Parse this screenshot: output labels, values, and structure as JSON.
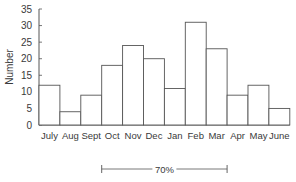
{
  "chart_data": {
    "type": "bar",
    "title": "",
    "xlabel": "",
    "ylabel": "Number",
    "categories": [
      "July",
      "Aug",
      "Sept",
      "Oct",
      "Nov",
      "Dec",
      "Jan",
      "Feb",
      "Mar",
      "Apr",
      "May",
      "June"
    ],
    "values": [
      12,
      4,
      9,
      18,
      24,
      20,
      11,
      31,
      23,
      9,
      12,
      5
    ],
    "ylim": [
      0,
      35
    ],
    "yticks": [
      0,
      5,
      10,
      15,
      20,
      25,
      30,
      35
    ],
    "grid": false,
    "legend": null,
    "annotations": [
      {
        "type": "bracket",
        "label": "70%",
        "from_category": "Oct",
        "to_category": "Mar"
      }
    ]
  },
  "colors": {
    "bar_fill": "#ffffff",
    "bar_stroke": "#555555",
    "axis": "#555555",
    "text": "#3a3a3a"
  }
}
